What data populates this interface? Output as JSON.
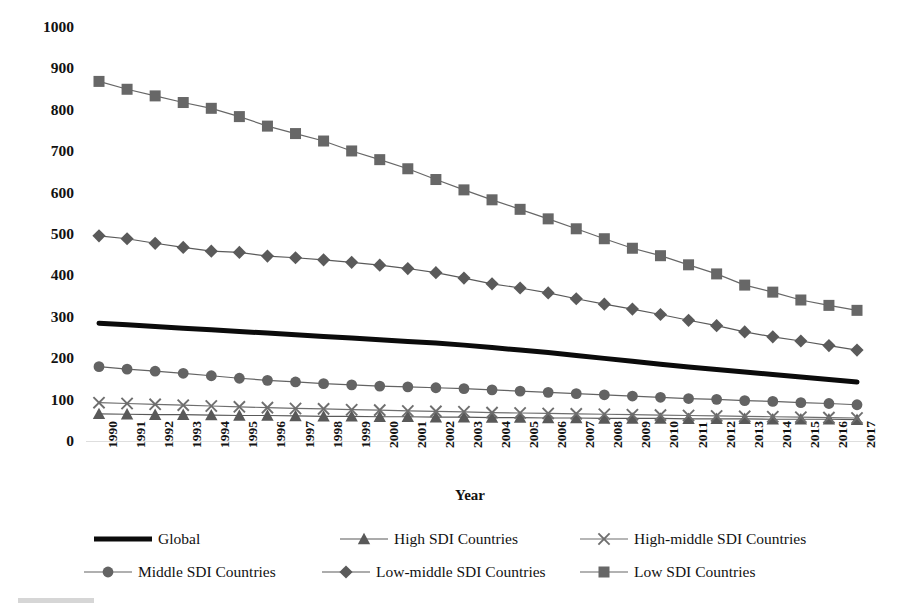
{
  "chart_data": {
    "type": "line",
    "title": "",
    "xlabel": "Year",
    "ylabel": "Deaths per 100,000 Population",
    "ylim": [
      0,
      1000
    ],
    "ytick_step": 100,
    "yticks": [
      "1000",
      "900",
      "800",
      "700",
      "600",
      "500",
      "400",
      "300",
      "200",
      "100",
      "0"
    ],
    "grid": false,
    "legend_position": "bottom",
    "categories": [
      "1990",
      "1991",
      "1992",
      "1993",
      "1994",
      "1995",
      "1996",
      "1997",
      "1998",
      "1999",
      "2000",
      "2001",
      "2002",
      "2003",
      "2004",
      "2005",
      "2006",
      "2007",
      "2008",
      "2009",
      "2010",
      "2011",
      "2012",
      "2013",
      "2014",
      "2015",
      "2016",
      "2017"
    ],
    "series": [
      {
        "name": "Global",
        "marker": "none",
        "color": "#0b0b0b",
        "line_width": 5,
        "values": [
          287,
          283,
          279,
          275,
          271,
          267,
          263,
          259,
          255,
          251,
          247,
          243,
          239,
          234,
          228,
          222,
          216,
          209,
          202,
          195,
          188,
          181,
          175,
          169,
          163,
          157,
          151,
          145
        ]
      },
      {
        "name": "High SDI Countries",
        "marker": "triangle",
        "color": "#595959",
        "line_width": 1.2,
        "values": [
          68,
          67,
          66,
          66,
          65,
          64,
          64,
          63,
          62,
          62,
          61,
          61,
          60,
          60,
          59,
          59,
          58,
          58,
          57,
          57,
          57,
          56,
          56,
          56,
          55,
          55,
          55,
          54
        ]
      },
      {
        "name": "High-middle SDI Countries",
        "marker": "cross",
        "color": "#6e6e6e",
        "line_width": 1.2,
        "values": [
          95,
          93,
          91,
          89,
          87,
          85,
          83,
          81,
          80,
          78,
          77,
          75,
          74,
          73,
          71,
          70,
          69,
          68,
          67,
          66,
          65,
          64,
          63,
          62,
          61,
          60,
          59,
          58
        ]
      },
      {
        "name": "Middle SDI Countries",
        "marker": "circle",
        "color": "#636363",
        "line_width": 1.2,
        "values": [
          182,
          176,
          171,
          166,
          160,
          154,
          149,
          145,
          141,
          138,
          135,
          133,
          131,
          129,
          126,
          123,
          120,
          117,
          114,
          111,
          108,
          105,
          103,
          100,
          98,
          95,
          93,
          90
        ]
      },
      {
        "name": "Low-middle SDI Countries",
        "marker": "diamond",
        "color": "#5a5a5a",
        "line_width": 1.2,
        "values": [
          498,
          491,
          480,
          470,
          461,
          458,
          449,
          445,
          440,
          434,
          427,
          419,
          409,
          396,
          382,
          372,
          360,
          346,
          333,
          321,
          308,
          294,
          281,
          266,
          254,
          244,
          233,
          222
        ]
      },
      {
        "name": "Low SDI Countries",
        "marker": "square",
        "color": "#676767",
        "line_width": 1.2,
        "values": [
          871,
          852,
          836,
          820,
          806,
          786,
          763,
          745,
          727,
          703,
          682,
          660,
          634,
          609,
          585,
          562,
          539,
          515,
          491,
          468,
          450,
          428,
          406,
          379,
          362,
          343,
          330,
          318
        ]
      }
    ]
  },
  "axis": {
    "ylabel": "Deaths per 100,000 Population",
    "xlabel": "Year"
  },
  "legend": {
    "items": [
      {
        "label": "Global",
        "marker": "none"
      },
      {
        "label": "High SDI Countries",
        "marker": "triangle"
      },
      {
        "label": "High-middle SDI Countries",
        "marker": "cross"
      },
      {
        "label": "Middle SDI Countries",
        "marker": "circle"
      },
      {
        "label": "Low-middle SDI Countries",
        "marker": "diamond"
      },
      {
        "label": "Low SDI Countries",
        "marker": "square"
      }
    ]
  }
}
